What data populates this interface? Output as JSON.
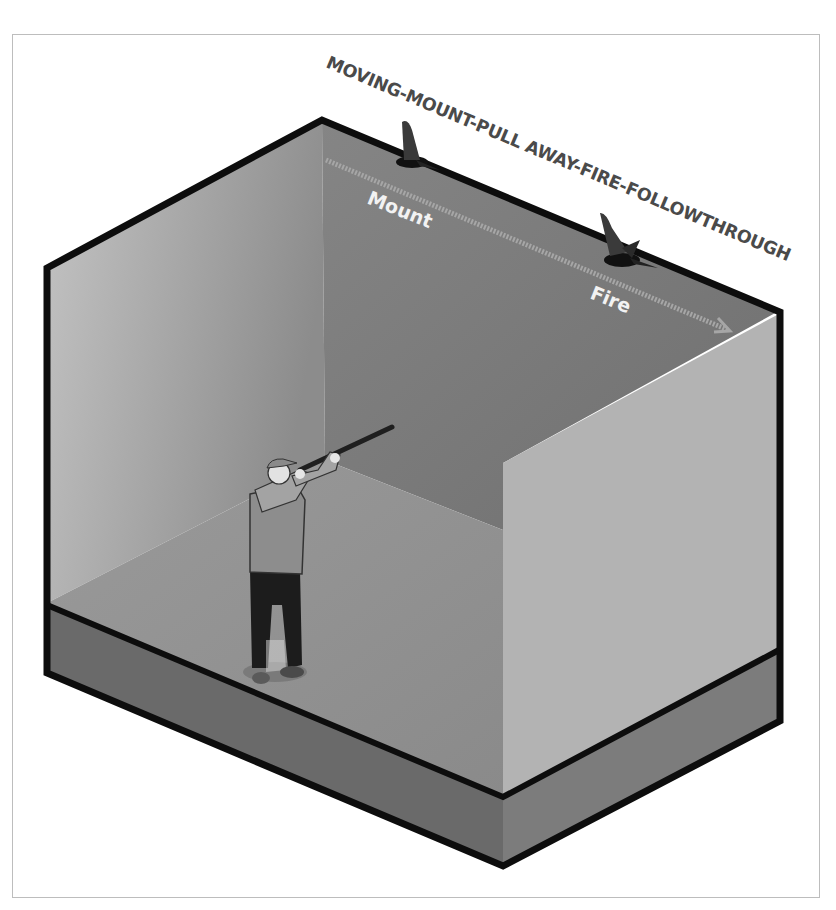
{
  "diagram": {
    "title": "MOVING-MOUNT-PULL AWAY-FIRE-FOLLOWTHROUGH",
    "labels": {
      "mount": "Mount",
      "fire": "Fire"
    },
    "figures": {
      "shooter": "shooter-with-shotgun",
      "bird_start": "bird-at-mount",
      "bird_end": "bird-at-fire"
    },
    "colors": {
      "outline": "#0d0d0d",
      "left_wall": "#a8a8a8",
      "back_wall": "#7a7a7a",
      "floor": "#8e8e8e",
      "front_wall": "#b2b2b2",
      "base": "#6e6e6e",
      "path_line": "#a9a9a9",
      "title_text": "#4a4a4a",
      "label_text": "#f2f2f2"
    }
  }
}
